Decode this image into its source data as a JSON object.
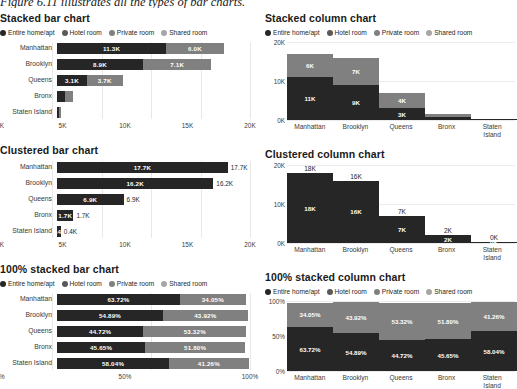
{
  "page": {
    "clipped_caption": "Figure 6.11 illustrates all the types of bar charts.",
    "colors": {
      "entire_home": "#262626",
      "hotel_room": "#595959",
      "private_room": "#808080",
      "shared_room": "#a6a6a6",
      "grid": "#ebebeb",
      "text": "#262626"
    }
  },
  "legend": {
    "items": [
      {
        "label": "Entire home/apt",
        "color": "#262626"
      },
      {
        "label": "Hotel room",
        "color": "#595959"
      },
      {
        "label": "Private room",
        "color": "#808080"
      },
      {
        "label": "Shared room",
        "color": "#a6a6a6"
      }
    ]
  },
  "chart_data": [
    {
      "id": "stacked-bar",
      "type": "bar",
      "orientation": "horizontal",
      "stacked": true,
      "title": "Stacked bar chart",
      "categories": [
        "Manhattan",
        "Brooklyn",
        "Queens",
        "Bronx",
        "Staten Island"
      ],
      "series": [
        {
          "name": "Entire home/apt",
          "color": "#262626",
          "values": [
            11300,
            8900,
            3100,
            800,
            230
          ],
          "labels": [
            "11.3K",
            "8.9K",
            "3.1K",
            "",
            ""
          ]
        },
        {
          "name": "Private room",
          "color": "#808080",
          "values": [
            6000,
            7100,
            3700,
            900,
            180
          ],
          "labels": [
            "6.0K",
            "7.1K",
            "3.7K",
            "",
            ""
          ]
        }
      ],
      "xlabel": "",
      "ylabel": "",
      "xlim": [
        0,
        20000
      ],
      "xticks": [
        0,
        5000,
        10000,
        15000,
        20000
      ],
      "xticklabels": [
        "0K",
        "5K",
        "10K",
        "15K",
        "20K"
      ],
      "grid": true,
      "legend_position": "top-left"
    },
    {
      "id": "stacked-column",
      "type": "bar",
      "orientation": "vertical",
      "stacked": true,
      "title": "Stacked column chart",
      "categories": [
        "Manhattan",
        "Brooklyn",
        "Queens",
        "Bronx",
        "Staten Island"
      ],
      "series": [
        {
          "name": "Entire home/apt",
          "color": "#262626",
          "values": [
            11000,
            9000,
            3000,
            700,
            200
          ],
          "labels": [
            "11K",
            "9K",
            "3K",
            "",
            ""
          ]
        },
        {
          "name": "Private room",
          "color": "#808080",
          "values": [
            6000,
            7000,
            4000,
            900,
            150
          ],
          "labels": [
            "6K",
            "7K",
            "4K",
            "",
            ""
          ]
        }
      ],
      "ylim": [
        0,
        20000
      ],
      "yticks": [
        0,
        10000,
        20000
      ],
      "yticklabels": [
        "0K",
        "10K",
        "20K"
      ],
      "grid": true,
      "legend_position": "top-left"
    },
    {
      "id": "clustered-bar",
      "type": "bar",
      "orientation": "horizontal",
      "stacked": false,
      "title": "Clustered bar chart",
      "categories": [
        "Manhattan",
        "Brooklyn",
        "Queens",
        "Bronx",
        "Staten Island"
      ],
      "series": [
        {
          "name": "Total",
          "color": "#262626",
          "values": [
            17700,
            16200,
            6900,
            1700,
            400
          ],
          "labels": [
            "17.7K",
            "16.2K",
            "6.9K",
            "1.7K",
            "0.4K"
          ]
        }
      ],
      "xlim": [
        0,
        20000
      ],
      "xticks": [
        0,
        5000,
        10000,
        15000,
        20000
      ],
      "xticklabels": [
        "0K",
        "5K",
        "10K",
        "15K",
        "20K"
      ],
      "grid": true,
      "legend_position": "none"
    },
    {
      "id": "clustered-column",
      "type": "bar",
      "orientation": "vertical",
      "stacked": false,
      "title": "Clustered column chart",
      "categories": [
        "Manhattan",
        "Brooklyn",
        "Queens",
        "Bronx",
        "Staten Island"
      ],
      "series": [
        {
          "name": "Total",
          "color": "#262626",
          "values": [
            18000,
            16000,
            7000,
            2000,
            300
          ],
          "labels": [
            "18K",
            "16K",
            "7K",
            "2K",
            "0K"
          ]
        }
      ],
      "ylim": [
        0,
        20000
      ],
      "yticks": [
        0,
        10000,
        20000
      ],
      "yticklabels": [
        "0K",
        "10K",
        "20K"
      ],
      "grid": true,
      "legend_position": "none"
    },
    {
      "id": "pct-stacked-bar",
      "type": "bar",
      "orientation": "horizontal",
      "stacked": true,
      "normalized": true,
      "title": "100% stacked bar chart",
      "categories": [
        "Manhattan",
        "Brooklyn",
        "Queens",
        "Bronx",
        "Staten Island"
      ],
      "series": [
        {
          "name": "Entire home/apt",
          "color": "#262626",
          "values": [
            63.72,
            54.89,
            44.72,
            45.65,
            58.04
          ],
          "labels": [
            "63.72%",
            "54.89%",
            "44.72%",
            "45.65%",
            "58.04%"
          ]
        },
        {
          "name": "Private room",
          "color": "#808080",
          "values": [
            34.05,
            43.92,
            53.32,
            51.8,
            41.26
          ],
          "labels": [
            "34.05%",
            "43.92%",
            "53.32%",
            "51.80%",
            "41.26%"
          ]
        }
      ],
      "xlim": [
        0,
        100
      ],
      "xticks": [
        0,
        50,
        100
      ],
      "xticklabels": [
        "0%",
        "50%",
        "100%"
      ],
      "grid": true,
      "legend_position": "top-left"
    },
    {
      "id": "pct-stacked-column",
      "type": "bar",
      "orientation": "vertical",
      "stacked": true,
      "normalized": true,
      "title": "100% stacked column chart",
      "categories": [
        "Manhattan",
        "Brooklyn",
        "Queens",
        "Bronx",
        "Staten Island"
      ],
      "series": [
        {
          "name": "Entire home/apt",
          "color": "#262626",
          "values": [
            63.72,
            54.89,
            44.72,
            45.65,
            58.04
          ],
          "labels": [
            "63.72%",
            "54.89%",
            "44.72%",
            "45.65%",
            "58.04%"
          ]
        },
        {
          "name": "Private room",
          "color": "#808080",
          "values": [
            34.05,
            43.92,
            53.32,
            51.8,
            41.26
          ],
          "labels": [
            "34.05%",
            "43.92%",
            "53.32%",
            "51.80%",
            "41.26%"
          ]
        }
      ],
      "ylim": [
        0,
        100
      ],
      "yticks": [
        0,
        50,
        100
      ],
      "yticklabels": [
        "0%",
        "50%",
        "100%"
      ],
      "grid": true,
      "legend_position": "top-left"
    }
  ]
}
